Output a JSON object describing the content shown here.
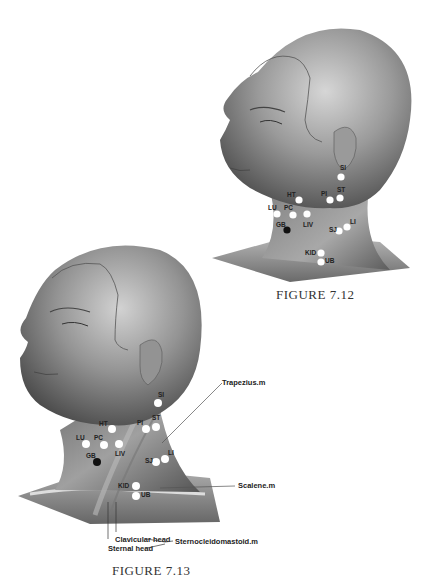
{
  "figures": [
    {
      "id": "fig-7-12",
      "caption": "FIGURE 7.12",
      "points": [
        {
          "label": "SI",
          "fill": "#ffffff"
        },
        {
          "label": "PI",
          "fill": "#ffffff"
        },
        {
          "label": "ST",
          "fill": "#ffffff"
        },
        {
          "label": "HT",
          "fill": "#ffffff"
        },
        {
          "label": "LU",
          "fill": "#ffffff"
        },
        {
          "label": "PC",
          "fill": "#ffffff"
        },
        {
          "label": "LIV",
          "fill": "#ffffff"
        },
        {
          "label": "GB",
          "fill": "#111111"
        },
        {
          "label": "SJ",
          "fill": "#ffffff"
        },
        {
          "label": "LI",
          "fill": "#ffffff"
        },
        {
          "label": "KID",
          "fill": "#ffffff"
        },
        {
          "label": "UB",
          "fill": "#ffffff"
        }
      ]
    },
    {
      "id": "fig-7-13",
      "caption": "FIGURE 7.13",
      "points": [
        {
          "label": "SI",
          "fill": "#ffffff"
        },
        {
          "label": "PI",
          "fill": "#ffffff"
        },
        {
          "label": "ST",
          "fill": "#ffffff"
        },
        {
          "label": "HT",
          "fill": "#ffffff"
        },
        {
          "label": "LU",
          "fill": "#ffffff"
        },
        {
          "label": "PC",
          "fill": "#ffffff"
        },
        {
          "label": "LIV",
          "fill": "#ffffff"
        },
        {
          "label": "GB",
          "fill": "#111111"
        },
        {
          "label": "SJ",
          "fill": "#ffffff"
        },
        {
          "label": "LI",
          "fill": "#ffffff"
        },
        {
          "label": "KID",
          "fill": "#ffffff"
        },
        {
          "label": "UB",
          "fill": "#ffffff"
        }
      ],
      "annotations": {
        "trapezius": "Trapezius.m",
        "scalene": "Scalene.m",
        "clavicular_head": "Clavicular head",
        "sternal_head": "Sternal head",
        "sternocleidomastoid": "Sternocleidomastoid.m"
      }
    }
  ],
  "colors": {
    "skin_dark": "#5a5a5a",
    "skin_mid": "#8c8c8c",
    "skin_light": "#c8c8c8",
    "background": "#ffffff"
  }
}
